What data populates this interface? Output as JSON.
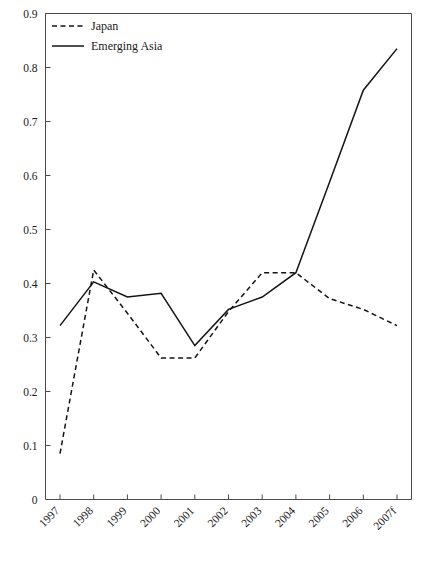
{
  "chart_data": {
    "type": "line",
    "title": "",
    "xlabel": "",
    "ylabel": "",
    "categories": [
      "1997",
      "1998",
      "1999",
      "2000",
      "2001",
      "2002",
      "2003",
      "2004",
      "2005",
      "2006",
      "2007f"
    ],
    "series": [
      {
        "name": "Japan",
        "style": "dashed",
        "color": "#141414",
        "values": [
          0.085,
          0.425,
          0.345,
          0.262,
          0.262,
          0.348,
          0.42,
          0.42,
          0.372,
          0.352,
          0.322
        ]
      },
      {
        "name": "Emerging Asia",
        "style": "solid",
        "color": "#141414",
        "values": [
          0.322,
          0.403,
          0.375,
          0.382,
          0.285,
          0.352,
          0.375,
          0.42,
          0.588,
          0.758,
          0.835
        ]
      }
    ],
    "ylim": [
      0,
      0.9
    ],
    "ytick_values": [
      0,
      0.1,
      0.2,
      0.3,
      0.4,
      0.5,
      0.6,
      0.7,
      0.8,
      0.9
    ],
    "ytick_labels": [
      "0",
      "0.1",
      "0.2",
      "0.3",
      "0.4",
      "0.5",
      "0.6",
      "0.7",
      "0.8",
      "0.9"
    ],
    "grid": false,
    "legend_position": "top-left",
    "legend": [
      {
        "label": "Japan",
        "style": "dashed"
      },
      {
        "label": "Emerging Asia",
        "style": "solid"
      }
    ]
  }
}
